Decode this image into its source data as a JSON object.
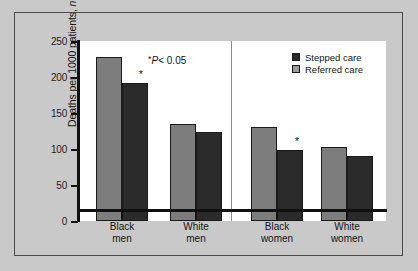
{
  "chart_data": {
    "type": "bar",
    "title": "",
    "subtitle": "",
    "xlabel": "",
    "ylabel": "Deaths per 1000 patients, n",
    "ylim": [
      0,
      250
    ],
    "yticks": [
      0,
      50,
      100,
      150,
      200,
      250
    ],
    "ytick_labels": [
      "0",
      "50",
      "100",
      "150",
      "200",
      "250"
    ],
    "grid": false,
    "legend_position": "top-right",
    "categories": [
      "Black men",
      "White men",
      "Black women",
      "White women"
    ],
    "category_lines": [
      [
        "Black",
        "men"
      ],
      [
        "White",
        "men"
      ],
      [
        "Black",
        "women"
      ],
      [
        "White",
        "women"
      ]
    ],
    "series": [
      {
        "name": "Referred care",
        "color": "#7d7d7d",
        "values": [
          228,
          135,
          131,
          103
        ]
      },
      {
        "name": "Stepped care",
        "color": "#2a2a2a",
        "values": [
          192,
          124,
          98,
          91
        ]
      }
    ],
    "annotations": {
      "significance_note": "*P< 0.05",
      "significance_note_parts": {
        "asterisk": "*",
        "p_symbol": "P",
        "comparison": "< 0.05"
      },
      "significance_marker": "*",
      "significant_bars": [
        {
          "category": "Black men",
          "series": "Stepped care"
        },
        {
          "category": "Black women",
          "series": "Stepped care"
        }
      ]
    },
    "panels": [
      {
        "name": "men",
        "categories": [
          "Black men",
          "White men"
        ]
      },
      {
        "name": "women",
        "categories": [
          "Black women",
          "White women"
        ]
      }
    ],
    "panel_divider": true,
    "colors": {
      "background": "#c9c9c9",
      "plot_background": "#ffffff",
      "axis": "#111111",
      "border": "#4a4a4a",
      "stepped_care": "#2a2a2a",
      "referred_care": "#7d7d7d",
      "legend_referred_swatch": "#9a9a9a"
    }
  },
  "legend": {
    "items": [
      {
        "label": "Stepped care",
        "swatch": "stepped"
      },
      {
        "label": "Referred care",
        "swatch": "referred"
      }
    ]
  }
}
